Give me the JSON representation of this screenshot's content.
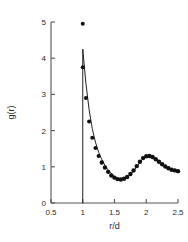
{
  "chart_data": {
    "type": "scatter",
    "title": "",
    "xlabel": "r/d",
    "ylabel": "g(r)",
    "xlim": [
      0.5,
      2.5
    ],
    "ylim": [
      0,
      5
    ],
    "grid": false,
    "legend_position": "none",
    "xticks": [
      "0.5",
      "1",
      "1.5",
      "2",
      "2.5"
    ],
    "xtick_values": [
      0.5,
      1,
      1.5,
      2,
      2.5
    ],
    "yticks": [
      "0",
      "1",
      "2",
      "3",
      "4",
      "5"
    ],
    "ytick_values": [
      0,
      1,
      2,
      3,
      4,
      5
    ],
    "series": [
      {
        "name": "simulation-points",
        "marker": "filled-circle",
        "color": "#101010",
        "x": [
          1.0,
          1.0,
          1.05,
          1.1,
          1.15,
          1.2,
          1.25,
          1.3,
          1.35,
          1.4,
          1.45,
          1.5,
          1.55,
          1.6,
          1.65,
          1.7,
          1.75,
          1.8,
          1.85,
          1.9,
          1.95,
          2.0,
          2.05,
          2.1,
          2.15,
          2.2,
          2.25,
          2.3,
          2.35,
          2.4,
          2.45,
          2.5
        ],
        "y": [
          4.95,
          3.75,
          2.9,
          2.25,
          1.8,
          1.52,
          1.3,
          1.12,
          0.98,
          0.86,
          0.76,
          0.7,
          0.66,
          0.65,
          0.67,
          0.72,
          0.8,
          0.9,
          1.02,
          1.14,
          1.24,
          1.29,
          1.3,
          1.27,
          1.21,
          1.14,
          1.07,
          1.01,
          0.96,
          0.92,
          0.9,
          0.88
        ]
      },
      {
        "name": "theory-curve",
        "marker": "none",
        "style": "solid-line",
        "color": "#202020",
        "x": [
          1.0,
          1.0,
          1.05,
          1.1,
          1.15,
          1.2,
          1.25,
          1.3,
          1.35,
          1.4,
          1.45,
          1.5,
          1.55,
          1.6,
          1.65,
          1.7,
          1.75,
          1.8,
          1.85,
          1.9,
          1.95,
          2.0,
          2.05,
          2.1,
          2.15,
          2.2,
          2.25,
          2.3,
          2.35,
          2.4,
          2.45,
          2.5
        ],
        "y": [
          0.0,
          4.25,
          3.3,
          2.58,
          2.05,
          1.68,
          1.4,
          1.2,
          1.04,
          0.91,
          0.81,
          0.73,
          0.68,
          0.66,
          0.67,
          0.71,
          0.78,
          0.88,
          1.0,
          1.12,
          1.22,
          1.28,
          1.3,
          1.28,
          1.22,
          1.15,
          1.08,
          1.02,
          0.97,
          0.93,
          0.9,
          0.88
        ]
      }
    ],
    "annotations": [
      {
        "name": "contact-value-point",
        "x": 1.0,
        "y": 4.95
      },
      {
        "name": "core-exclusion-line",
        "x": 1.0,
        "y_from": 0.0,
        "y_to": 4.25
      }
    ]
  }
}
